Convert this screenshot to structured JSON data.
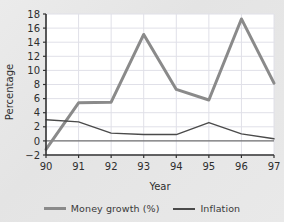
{
  "chart_data": {
    "type": "line",
    "title": "",
    "xlabel": "Year",
    "ylabel": "Percentage",
    "x": [
      "90",
      "91",
      "92",
      "93",
      "94",
      "95",
      "96",
      "97"
    ],
    "categories": [
      "90",
      "91",
      "92",
      "93",
      "94",
      "95",
      "96",
      "97"
    ],
    "series": [
      {
        "name": "Money growth (%)",
        "color": "#8a8a8a",
        "linewidth": 3,
        "values": [
          -1.2,
          5.4,
          5.5,
          15.1,
          7.3,
          5.8,
          17.3,
          8.2
        ]
      },
      {
        "name": "Inflation",
        "color": "#4a4a4a",
        "linewidth": 1.4,
        "values": [
          3.0,
          2.7,
          1.1,
          0.9,
          0.9,
          2.6,
          1.0,
          0.3
        ]
      }
    ],
    "ylim": [
      -2,
      18
    ],
    "xlim": [
      "90",
      "97"
    ],
    "yticks": [
      -2,
      0,
      2,
      4,
      6,
      8,
      10,
      12,
      14,
      16,
      18
    ],
    "ytick_labels": [
      "−2",
      "0",
      "2",
      "4",
      "6",
      "8",
      "10",
      "12",
      "14",
      "16",
      "18"
    ],
    "xticks": [
      "90",
      "91",
      "92",
      "93",
      "94",
      "95",
      "96",
      "97"
    ],
    "grid": true,
    "grid_color": "#e0e0e8",
    "zero_line": true,
    "zero_line_color": "#555555",
    "legend_position": "bottom",
    "plot_background": "#ffffff",
    "figure_background": "#e7e7e7"
  },
  "legend": {
    "entries": [
      {
        "label": "Money growth (%)",
        "swatch": "money"
      },
      {
        "label": "Inflation",
        "swatch": "infl"
      }
    ]
  },
  "axes": {
    "y_title": "Percentage",
    "x_title": "Year"
  }
}
